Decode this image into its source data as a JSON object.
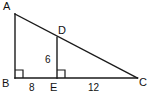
{
  "figure": {
    "background_color": "#ffffff",
    "stroke_color": "#1a1a1a",
    "vertices": [
      {
        "name": "A",
        "label": "A",
        "x": 15,
        "y": 14
      },
      {
        "name": "B",
        "label": "B",
        "x": 15,
        "y": 78
      },
      {
        "name": "C",
        "label": "C",
        "x": 137,
        "y": 78
      },
      {
        "name": "D",
        "label": "D",
        "x": 57,
        "y": 38
      },
      {
        "name": "E",
        "label": "E",
        "x": 57,
        "y": 78
      }
    ],
    "segments": [
      {
        "name": "segment-ab",
        "from": "A",
        "to": "B"
      },
      {
        "name": "segment-bc",
        "from": "B",
        "to": "C"
      },
      {
        "name": "segment-ac",
        "from": "A",
        "to": "C"
      },
      {
        "name": "segment-de",
        "from": "D",
        "to": "E"
      }
    ],
    "right_angles": [
      {
        "name": "right-angle-b",
        "at": "B"
      },
      {
        "name": "right-angle-e",
        "at": "E"
      }
    ],
    "measures": [
      {
        "name": "length-de",
        "label": "6",
        "segment": "DE"
      },
      {
        "name": "length-be",
        "label": "8",
        "segment": "BE"
      },
      {
        "name": "length-ec",
        "label": "12",
        "segment": "EC"
      }
    ],
    "labels": {
      "a": "A",
      "b": "B",
      "c": "C",
      "d": "D",
      "e": "E",
      "de": "6",
      "be": "8",
      "ec": "12"
    }
  }
}
